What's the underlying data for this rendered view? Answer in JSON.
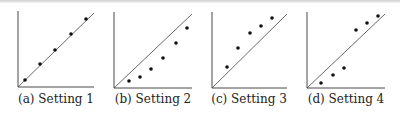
{
  "chart_data": [
    {
      "type": "scatter",
      "title": "(a) Setting 1",
      "reference_line": "y = x diagonal",
      "axes": {
        "x_ticks": [],
        "y_ticks": [],
        "grid": false
      },
      "points": [
        [
          0.1,
          0.1
        ],
        [
          0.3,
          0.31
        ],
        [
          0.5,
          0.5
        ],
        [
          0.7,
          0.71
        ],
        [
          0.9,
          0.9
        ]
      ],
      "axis_px": {
        "x0": 18,
        "y0": 87,
        "x1": 94,
        "y1": 12
      },
      "points_px": [
        [
          25,
          80
        ],
        [
          40,
          64
        ],
        [
          55,
          50
        ],
        [
          71,
          34
        ],
        [
          86,
          19
        ]
      ]
    },
    {
      "type": "scatter",
      "title": "(b) Setting 2",
      "reference_line": "y = x diagonal",
      "axes": {
        "x_ticks": [],
        "y_ticks": [],
        "grid": false
      },
      "points": [
        [
          0.19,
          0.09
        ],
        [
          0.33,
          0.14
        ],
        [
          0.48,
          0.25
        ],
        [
          0.63,
          0.4
        ],
        [
          0.8,
          0.6
        ],
        [
          0.95,
          0.8
        ]
      ],
      "axis_px": {
        "x0": 114,
        "y0": 88,
        "x1": 192,
        "y1": 13
      },
      "points_px": [
        [
          129,
          81
        ],
        [
          140,
          77
        ],
        [
          151,
          69
        ],
        [
          163,
          58
        ],
        [
          176,
          43
        ],
        [
          187,
          28
        ]
      ]
    },
    {
      "type": "scatter",
      "title": "(c) Setting 3",
      "reference_line": "y = x diagonal",
      "axes": {
        "x_ticks": [],
        "y_ticks": [],
        "grid": false
      },
      "points": [
        [
          0.2,
          0.28
        ],
        [
          0.35,
          0.53
        ],
        [
          0.5,
          0.73
        ],
        [
          0.65,
          0.83
        ],
        [
          0.8,
          0.93
        ]
      ],
      "axis_px": {
        "x0": 212,
        "y0": 88,
        "x1": 287,
        "y1": 13
      },
      "points_px": [
        [
          227,
          67
        ],
        [
          238,
          48
        ],
        [
          250,
          33
        ],
        [
          261,
          26
        ],
        [
          272,
          18
        ]
      ]
    },
    {
      "type": "scatter",
      "title": "(d) Setting 4",
      "reference_line": "y = x diagonal",
      "axes": {
        "x_ticks": [],
        "y_ticks": [],
        "grid": false
      },
      "points": [
        [
          0.18,
          0.07
        ],
        [
          0.34,
          0.17
        ],
        [
          0.48,
          0.27
        ],
        [
          0.64,
          0.77
        ],
        [
          0.79,
          0.86
        ],
        [
          0.94,
          0.95
        ]
      ],
      "axis_px": {
        "x0": 307,
        "y0": 88,
        "x1": 385,
        "y1": 13
      },
      "points_px": [
        [
          321,
          83
        ],
        [
          333,
          75
        ],
        [
          344,
          68
        ],
        [
          356,
          30
        ],
        [
          367,
          23
        ],
        [
          378,
          16
        ]
      ]
    }
  ],
  "captions": [
    "(a) Setting 1",
    "(b) Setting 2",
    "(c) Setting 3",
    "(d) Setting 4"
  ],
  "colors": {
    "axis": "#333333",
    "line": "#444444",
    "point": "#111111"
  }
}
